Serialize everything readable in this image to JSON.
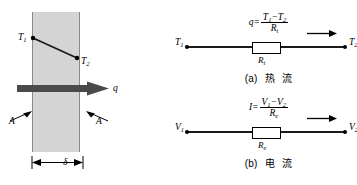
{
  "figure": {
    "type": "thermal-electrical-analogy-diagram",
    "panels": [
      "conduction-slab",
      "resistance-network"
    ]
  },
  "slab": {
    "temp_hot_label": "T",
    "temp_hot_sub": "1",
    "temp_cold_label": "T",
    "temp_cold_sub": "2",
    "flux_label": "q",
    "area_label_left": "A",
    "area_label_right": "A",
    "thickness_label": "δ",
    "fill_color": "#d4d4d4",
    "edge_color": "#8a8a8a",
    "arrow_color": "#4a4a4a"
  },
  "circuit_a": {
    "formula": {
      "lhs": "q",
      "equals": "=",
      "numerator_first": "T",
      "numerator_first_sub": "1",
      "minus": "−",
      "numerator_second": "T",
      "numerator_second_sub": "2",
      "denominator": "R",
      "denominator_sub": "t"
    },
    "terminal_left": "T",
    "terminal_left_sub": "1",
    "terminal_right": "T",
    "terminal_right_sub": "2",
    "resistor_label": "R",
    "resistor_label_sub": "t",
    "caption_index": "(a)",
    "caption_text_1": "热",
    "caption_text_2": "流"
  },
  "circuit_b": {
    "formula": {
      "lhs": "I",
      "equals": "=",
      "numerator_first": "V",
      "numerator_first_sub": "1",
      "minus": "−",
      "numerator_second": "V",
      "numerator_second_sub": "2",
      "denominator": "R",
      "denominator_sub": "e"
    },
    "terminal_left": "V",
    "terminal_left_sub": "1",
    "terminal_right": "V",
    "terminal_right_sub": "2",
    "resistor_label": "R",
    "resistor_label_sub": "e",
    "caption_index": "(b)",
    "caption_text_1": "电",
    "caption_text_2": "流"
  },
  "colors": {
    "ink": "#000000",
    "wire": "#1a1a1a",
    "slab_fill": "#d4d4d4",
    "slab_edge": "#8a8a8a",
    "heat_arrow": "#4a4a4a",
    "background": "#ffffff"
  }
}
